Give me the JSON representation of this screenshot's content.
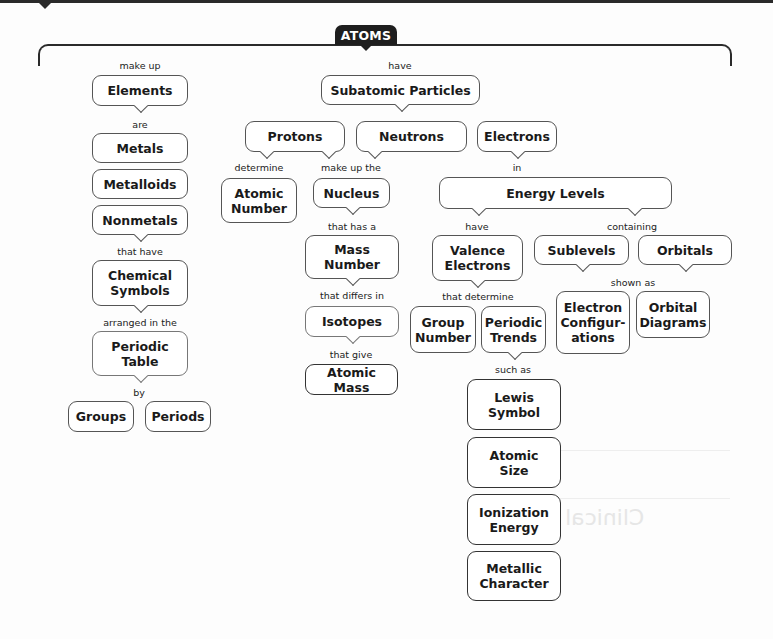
{
  "title": "ATOMS",
  "links": {
    "make_up": "make up",
    "have_top": "have",
    "are": "are",
    "that_have": "that have",
    "arranged_in_the": "arranged in the",
    "by": "by",
    "determine": "determine",
    "make_up_the": "make up the",
    "in": "in",
    "that_has_a": "that has a",
    "that_differs_in": "that differs in",
    "that_give": "that give",
    "have_valence": "have",
    "containing": "containing",
    "shown_as": "shown as",
    "that_determine": "that determine",
    "such_as": "such as"
  },
  "nodes": {
    "elements": "Elements",
    "metals": "Metals",
    "metalloids": "Metalloids",
    "nonmetals": "Nonmetals",
    "chemical_symbols": "Chemical Symbols",
    "periodic_table": "Periodic Table",
    "groups": "Groups",
    "periods": "Periods",
    "subatomic_particles": "Subatomic Particles",
    "protons": "Protons",
    "neutrons": "Neutrons",
    "electrons": "Electrons",
    "atomic_number": "Atomic Number",
    "nucleus": "Nucleus",
    "mass_number": "Mass Number",
    "isotopes": "Isotopes",
    "atomic_mass": "Atomic Mass",
    "energy_levels": "Energy Levels",
    "valence_electrons": "Valence Electrons",
    "sublevels": "Sublevels",
    "orbitals": "Orbitals",
    "group_number": "Group Number",
    "periodic_trends": "Periodic Trends",
    "electron_configurations": "Electron Configur-ations",
    "orbital_diagrams": "Orbital Diagrams",
    "lewis_symbol": "Lewis Symbol",
    "atomic_size": "Atomic Size",
    "ionization_energy": "Ionization Energy",
    "metallic_character": "Metallic Character"
  },
  "colors": {
    "title_bg": "#1e1e1e",
    "title_text": "#ffffff",
    "node_border": "#555555",
    "background": "#fdfdfd"
  }
}
